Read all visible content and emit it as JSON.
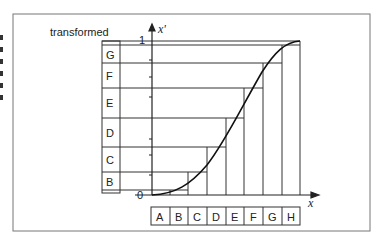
{
  "figure": {
    "y_axis_title": "transformed",
    "y_axis_var": "x'",
    "x_axis_var": "x",
    "y_tick_top": "1",
    "origin_label": "0",
    "input_bins": [
      "A",
      "B",
      "C",
      "D",
      "E",
      "F",
      "G",
      "H"
    ],
    "output_bins": [
      "G",
      "F",
      "E",
      "D",
      "C",
      "B"
    ],
    "colors": {
      "line": "#333333",
      "frame": "#777777",
      "background": "#ffffff"
    }
  }
}
